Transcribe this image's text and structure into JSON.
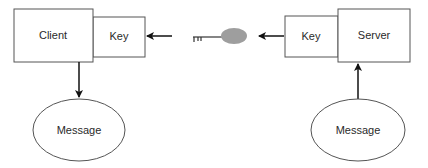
{
  "diagram": {
    "nodes": {
      "client": {
        "label": "Client"
      },
      "client_key": {
        "label": "Key"
      },
      "server": {
        "label": "Server"
      },
      "server_key": {
        "label": "Key"
      },
      "client_message": {
        "label": "Message"
      },
      "server_message": {
        "label": "Message"
      }
    },
    "center_icon": "key-icon",
    "colors": {
      "stroke": "#555555",
      "arrow": "#111111",
      "key_head": "#9e9e9e",
      "text": "#2a2a2a"
    },
    "edges": [
      {
        "from": "key-icon",
        "to": "client_key",
        "direction": "left"
      },
      {
        "from": "server_key",
        "to": "key-icon",
        "direction": "left"
      },
      {
        "from": "client",
        "to": "client_message",
        "direction": "down"
      },
      {
        "from": "server_message",
        "to": "server",
        "direction": "up"
      }
    ]
  }
}
